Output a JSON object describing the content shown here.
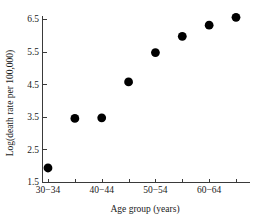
{
  "chart_data": {
    "type": "scatter",
    "title": "",
    "xlabel": "Age group (years)",
    "ylabel": "Log(death rate per 100,000)",
    "categories": [
      "30-34",
      "35-39",
      "40-44",
      "45-49",
      "50-54",
      "55-59",
      "60-64",
      "65-69"
    ],
    "x_tick_labels": [
      "30−34",
      "40−44",
      "50−54",
      "60−64"
    ],
    "x_tick_label_indices": [
      0,
      2,
      4,
      6
    ],
    "y_tick_labels": [
      "1.5",
      "2.5",
      "3.5",
      "4.5",
      "5.5",
      "6.5"
    ],
    "y_tick_values": [
      1.5,
      2.5,
      3.5,
      4.5,
      5.5,
      6.5
    ],
    "values": [
      1.93,
      3.45,
      3.47,
      4.57,
      5.47,
      5.97,
      6.31,
      6.55
    ],
    "ylim": [
      1.5,
      6.75
    ],
    "grid": false,
    "legend": "none",
    "marker": "filled-circle",
    "marker_color": "#000000",
    "marker_size": 4.4
  }
}
